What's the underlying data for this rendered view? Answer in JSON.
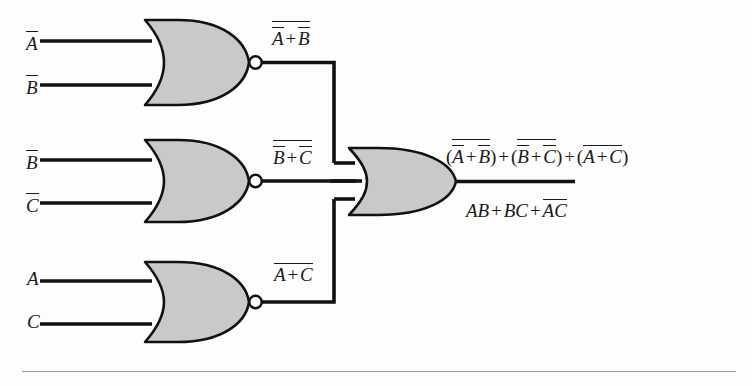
{
  "figure": {
    "kind": "logic-circuit-diagram",
    "colors": {
      "gate_fill": "#c9c9c9",
      "gate_stroke": "#111111",
      "wire": "#111111",
      "bubble_fill": "#ffffff",
      "rule": "#9a9a9a",
      "background": "#fdfdfd"
    }
  },
  "inputs": [
    {
      "name": "input-a-bar",
      "var": "A",
      "overbar": true,
      "gate": 1,
      "pin": "top"
    },
    {
      "name": "input-b-bar",
      "var": "B",
      "overbar": true,
      "gate": 1,
      "pin": "bottom"
    },
    {
      "name": "input-b-bar-2",
      "var": "B",
      "overbar": true,
      "gate": 2,
      "pin": "top"
    },
    {
      "name": "input-c-bar",
      "var": "C",
      "overbar": true,
      "gate": 2,
      "pin": "bottom"
    },
    {
      "name": "input-a",
      "var": "A",
      "overbar": false,
      "gate": 3,
      "pin": "top"
    },
    {
      "name": "input-c",
      "var": "C",
      "overbar": false,
      "gate": 3,
      "pin": "bottom"
    }
  ],
  "gates": [
    {
      "name": "nor-gate-1",
      "type": "NOR",
      "inputs": 2,
      "bubble": true,
      "output_label": "NOT(NOT A + NOT B)"
    },
    {
      "name": "nor-gate-2",
      "type": "NOR",
      "inputs": 2,
      "bubble": true,
      "output_label": "NOT(NOT B + NOT C)"
    },
    {
      "name": "nor-gate-3",
      "type": "NOR",
      "inputs": 2,
      "bubble": true,
      "output_label": "NOT(A + C)"
    },
    {
      "name": "or-gate-final",
      "type": "OR",
      "inputs": 3,
      "bubble": false,
      "output_label": "sum of the three NOR outputs"
    }
  ],
  "labels": {
    "gate1_out": {
      "A": "A",
      "B": "B",
      "plus": "+"
    },
    "gate2_out": {
      "B": "B",
      "C": "C",
      "plus": "+"
    },
    "gate3_out": {
      "A": "A",
      "C": "C",
      "plus": "+"
    },
    "final_out_top": {
      "A": "A",
      "B": "B",
      "C": "C",
      "plus": "+",
      "open": "(",
      "close": ")"
    },
    "final_out_bottom": {
      "term1_a": "A",
      "term1_b": "B",
      "term2_b": "B",
      "term2_c": "C",
      "term3_a": "A",
      "term3_c": "C",
      "plus": "+"
    }
  },
  "plain_text": {
    "gate1_output": "NOT( NOT A + NOT B )",
    "gate2_output": "NOT( NOT B + NOT C )",
    "gate3_output": "NOT( A + C )",
    "final_output_top": "(NOT(NOT A + NOT B)) + (NOT(NOT B + NOT C)) + (NOT(A + C))",
    "final_output_bottom": "AB + BC + (NOT A)(NOT C)"
  }
}
